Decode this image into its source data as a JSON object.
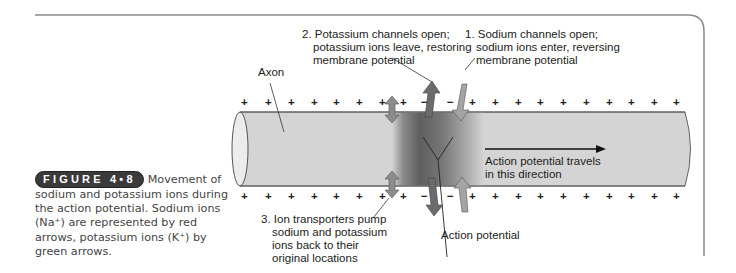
{
  "figure": {
    "badge": "FIGURE 4•8",
    "caption_lines": [
      "Movement of",
      "sodium and potassium ions during",
      "the action potential. Sodium ions",
      "(Na⁺) are represented by red",
      "arrows, potassium ions (K⁺) by",
      "green arrows."
    ]
  },
  "labels": {
    "axon": "Axon",
    "step2": {
      "line1": "2. Potassium channels open;",
      "line2": "potassium ions leave, restoring",
      "line3": "membrane potential"
    },
    "step1": {
      "line1": "1. Sodium channels open;",
      "line2": "sodium ions enter, reversing",
      "line3": "membrane potential"
    },
    "step3": {
      "line1": "3. Ion transporters pump",
      "line2": "sodium and potassium",
      "line3": "ions back to their",
      "line4": "original locations"
    },
    "direction": {
      "line1": "Action potential travels",
      "line2": "in this direction"
    },
    "action_potential": "Action potential"
  },
  "charges": {
    "top_row": [
      "+",
      "+",
      "+",
      "+",
      "+",
      "+",
      "+",
      "+",
      "−",
      "−",
      "+",
      "+",
      "+",
      "+",
      "+",
      "+",
      "+",
      "+",
      "+",
      "+"
    ],
    "bottom_row": [
      "+",
      "+",
      "+",
      "+",
      "+",
      "+",
      "+",
      "+",
      "−",
      "−",
      "+",
      "+",
      "+",
      "+",
      "+",
      "+",
      "+",
      "+",
      "+",
      "+"
    ]
  },
  "colors": {
    "axon_fill": "#d4d4d4",
    "axon_dark_band": "#6e6e6e",
    "potassium_arrow": "#6b6b6b",
    "sodium_arrow": "#9c9c9c",
    "pump_arrow": "#8c8c8c",
    "frame": "#8a8a8a"
  }
}
